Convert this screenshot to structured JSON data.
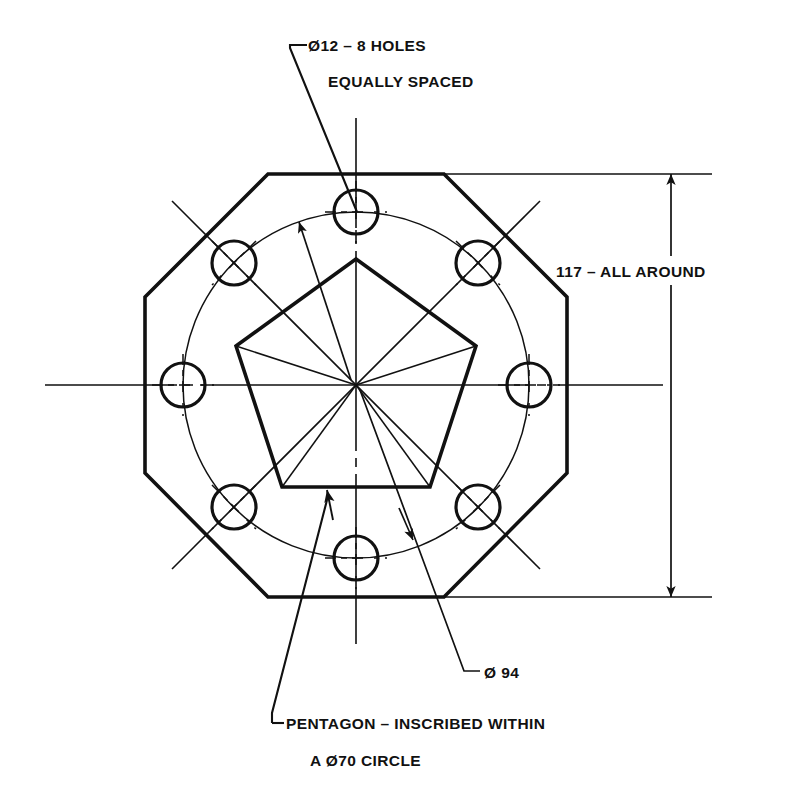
{
  "drawing": {
    "title": "Octagonal plate with 8-hole bolt circle and inscribed pentagon",
    "background_color": "#ffffff",
    "line_color": "#111111",
    "annotations": {
      "holes_note_line1": "Ø12 – 8 HOLES",
      "holes_note_line2": "EQUALLY SPACED",
      "across_flats_note": "117 – ALL AROUND",
      "bolt_circle_note": "Ø 94",
      "pentagon_note_line1": "PENTAGON – INSCRIBED WITHIN",
      "pentagon_note_line2": "A Ø70 CIRCLE"
    },
    "dimensions": {
      "hole_diameter": "Ø12",
      "hole_count": "8 HOLES",
      "hole_spacing": "EQUALLY SPACED",
      "across_flats": "117",
      "across_flats_qualifier": "ALL AROUND",
      "bolt_circle_diameter": "Ø 94",
      "pentagon_circumscribed_circle": "Ø70"
    },
    "geometry": {
      "center": {
        "x": 356,
        "y": 385
      },
      "octagon_across_flats_px": 423,
      "bolt_circle_radius_px": 173,
      "hole_radius_px": 22,
      "pentagon_circumradius_px": 126,
      "pentagon_apex_angle_deg": -90,
      "hole_angles_deg": [
        -90,
        -45,
        0,
        45,
        90,
        135,
        180,
        -135
      ]
    },
    "icons": {
      "diameter_symbol": "Ø",
      "dimension_arrow": "arrow-icon",
      "leader_arrow": "leader-arrow-icon"
    }
  }
}
